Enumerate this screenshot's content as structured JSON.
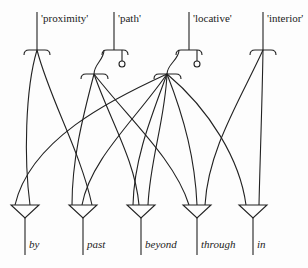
{
  "diagram": {
    "type": "network",
    "top_nodes": [
      {
        "id": "proximity",
        "label": "'proximity'",
        "x": 37
      },
      {
        "id": "path",
        "label": "'path'",
        "x": 114
      },
      {
        "id": "locative",
        "label": "'locative'",
        "x": 189
      },
      {
        "id": "interior",
        "label": "'interior'",
        "x": 263
      }
    ],
    "bottom_nodes": [
      {
        "id": "by",
        "label": "by",
        "x": 25
      },
      {
        "id": "past",
        "label": "past",
        "x": 83
      },
      {
        "id": "beyond",
        "label": "beyond",
        "x": 141
      },
      {
        "id": "through",
        "label": "through",
        "x": 197
      },
      {
        "id": "in",
        "label": "in",
        "x": 253
      }
    ],
    "connections": [
      {
        "from": "proximity",
        "to": "by"
      },
      {
        "from": "proximity",
        "to": "past"
      },
      {
        "from": "path",
        "to": "past"
      },
      {
        "from": "path",
        "to": "beyond"
      },
      {
        "from": "path",
        "to": "through"
      },
      {
        "from": "locative",
        "to": "by"
      },
      {
        "from": "locative",
        "to": "past"
      },
      {
        "from": "locative",
        "to": "beyond"
      },
      {
        "from": "locative",
        "to": "through"
      },
      {
        "from": "locative",
        "to": "in"
      },
      {
        "from": "interior",
        "to": "through"
      },
      {
        "from": "interior",
        "to": "in"
      }
    ],
    "colors": {
      "line": "#222222",
      "background": "#fdfdfd"
    }
  }
}
